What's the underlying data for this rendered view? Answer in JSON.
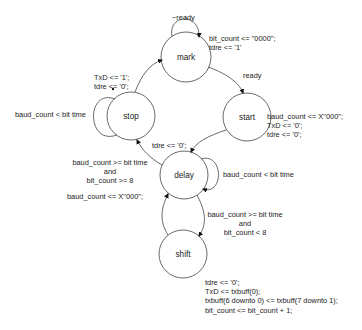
{
  "diagram": {
    "type": "state-machine",
    "states": [
      {
        "id": "mark",
        "label": "mark",
        "cx": 186,
        "cy": 57,
        "r": 25
      },
      {
        "id": "stop",
        "label": "stop",
        "cx": 131,
        "cy": 116,
        "r": 24
      },
      {
        "id": "start",
        "label": "start",
        "cx": 247,
        "cy": 117,
        "r": 24
      },
      {
        "id": "delay",
        "label": "delay",
        "cx": 184,
        "cy": 175,
        "r": 24
      },
      {
        "id": "shift",
        "label": "shift",
        "cx": 183,
        "cy": 254,
        "r": 24
      }
    ],
    "transitions": [
      {
        "from": "mark",
        "to": "mark",
        "condition": "~ready",
        "action": "bit_count <= \"0000\";\ntdre <= '1'"
      },
      {
        "from": "mark",
        "to": "start",
        "condition": "ready",
        "action": "baud_count <= X\"000\";\nTxD <= '0';\ntdre <= '0';"
      },
      {
        "from": "start",
        "to": "delay",
        "condition": "",
        "action": "tdre <= '0';"
      },
      {
        "from": "delay",
        "to": "delay",
        "condition": "baud_count < bit time",
        "action": ""
      },
      {
        "from": "delay",
        "to": "shift",
        "condition": "baud_count >= bit time\nand\nbit_count < 8",
        "action": "tdre <= '0';\nTxD <= txbuff(0);\ntxbuff(6 downto 0) <= txbuff(7 downto 1);\nbit_count <= bit_count + 1;"
      },
      {
        "from": "shift",
        "to": "delay",
        "condition": "",
        "action": ""
      },
      {
        "from": "delay",
        "to": "stop",
        "condition": "baud_count >= bit time\nand\nbit_count >= 8",
        "action": "baud_count <= X\"000\";"
      },
      {
        "from": "stop",
        "to": "stop",
        "condition": "baud_count < bit time",
        "action": ""
      },
      {
        "from": "stop",
        "to": "mark",
        "condition": "",
        "action": "TxD <= '1';\ntdre <= '0';"
      }
    ]
  },
  "labels": {
    "not_ready": "~ready",
    "mark_action": "bit_count <= \"0000\";\ntdre <= '1'",
    "ready": "ready",
    "start_action": "baud_count <= X\"000\";\nTxD <= '0';\ntdre <= '0';",
    "stop_to_mark_action": "TxD <= '1';\ntdre <= '0';",
    "stop_loop_cond": "baud_count < bit time",
    "start_to_delay_action": "tdre <= '0';",
    "delay_to_stop_cond": "baud_count >= bit time\nand\nbit_count >= 8",
    "delay_to_stop_action": "baud_count <= X\"000\";",
    "delay_loop_cond": "baud_count < bit time",
    "delay_to_shift_cond": "baud_count >= bit time\nand\nbit_count < 8",
    "shift_action": "tdre <= '0';\nTxD <= txbuff(0);\ntxbuff(6 downto 0) <= txbuff(7 downto 1);\nbit_count <= bit_count + 1;"
  }
}
